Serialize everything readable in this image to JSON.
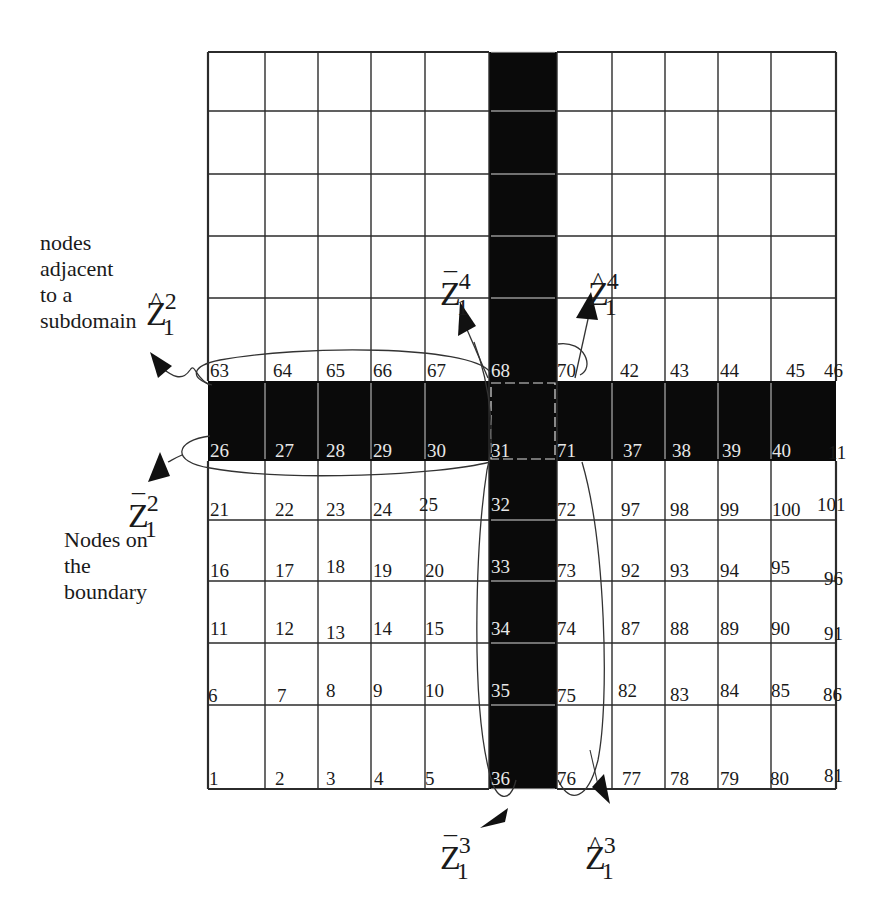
{
  "figure": {
    "colors": {
      "grid_line": "#2b2b2b",
      "separator_band": "#0a0a0a",
      "background": "#ffffff",
      "node_label_on_band": "#e8e8e8"
    }
  },
  "annotations": {
    "adjacent_label": [
      "nodes",
      "adjacent",
      "to a",
      "subdomain"
    ],
    "boundary_label": [
      "Nodes on",
      "the",
      "boundary"
    ],
    "symbols": {
      "zhat_1_2": {
        "base": "Z",
        "accent": "hat",
        "sub": "1",
        "sup": "2"
      },
      "zbar_1_2": {
        "base": "Z",
        "accent": "bar",
        "sub": "1",
        "sup": "2"
      },
      "zbar_1_4": {
        "base": "Z",
        "accent": "bar",
        "sub": "1",
        "sup": "4"
      },
      "zhat_1_4": {
        "base": "Z",
        "accent": "hat",
        "sub": "1",
        "sup": "4"
      },
      "zbar_1_3": {
        "base": "Z",
        "accent": "bar",
        "sub": "1",
        "sup": "3"
      },
      "zhat_1_3": {
        "base": "Z",
        "accent": "hat",
        "sub": "1",
        "sup": "3"
      }
    }
  },
  "grid": {
    "columns_x": [
      208,
      265,
      318,
      371,
      425,
      489,
      557,
      612,
      665,
      718,
      771,
      836
    ],
    "rows_y": [
      52,
      111,
      174,
      236,
      298,
      381,
      461,
      520,
      581,
      643,
      705,
      789
    ],
    "separator": {
      "vertical": {
        "x1": 489,
        "x2": 557
      },
      "horizontal": {
        "y1": 381,
        "y2": 461
      }
    }
  },
  "node_labels": {
    "row_top_of_band": [
      {
        "t": "63",
        "x": 210,
        "y": 380
      },
      {
        "t": "64",
        "x": 273,
        "y": 380
      },
      {
        "t": "65",
        "x": 326,
        "y": 380
      },
      {
        "t": "66",
        "x": 373,
        "y": 380
      },
      {
        "t": "67",
        "x": 427,
        "y": 380
      },
      {
        "t": "68",
        "x": 491,
        "y": 380,
        "light": true
      },
      {
        "t": "70",
        "x": 557,
        "y": 380
      },
      {
        "t": "42",
        "x": 620,
        "y": 380
      },
      {
        "t": "43",
        "x": 670,
        "y": 380
      },
      {
        "t": "44",
        "x": 720,
        "y": 380
      },
      {
        "t": "45",
        "x": 786,
        "y": 380
      },
      {
        "t": "46",
        "x": 824,
        "y": 380
      }
    ],
    "row_bottom_of_band": [
      {
        "t": "26",
        "x": 210,
        "y": 460,
        "light": true
      },
      {
        "t": "27",
        "x": 275,
        "y": 460,
        "light": true
      },
      {
        "t": "28",
        "x": 326,
        "y": 460,
        "light": true
      },
      {
        "t": "29",
        "x": 373,
        "y": 460,
        "light": true
      },
      {
        "t": "30",
        "x": 427,
        "y": 460,
        "light": true
      },
      {
        "t": "31",
        "x": 491,
        "y": 460,
        "light": true
      },
      {
        "t": "71",
        "x": 557,
        "y": 460,
        "light": true
      },
      {
        "t": "37",
        "x": 623,
        "y": 460,
        "light": true
      },
      {
        "t": "38",
        "x": 672,
        "y": 460,
        "light": true
      },
      {
        "t": "39",
        "x": 722,
        "y": 460,
        "light": true
      },
      {
        "t": "40",
        "x": 772,
        "y": 460,
        "light": true
      },
      {
        "t": "11",
        "x": 828,
        "y": 462
      }
    ],
    "row_520": [
      {
        "t": "21",
        "x": 210,
        "y": 519
      },
      {
        "t": "22",
        "x": 275,
        "y": 519
      },
      {
        "t": "23",
        "x": 326,
        "y": 519
      },
      {
        "t": "24",
        "x": 373,
        "y": 519
      },
      {
        "t": "25",
        "x": 419,
        "y": 514
      },
      {
        "t": "32",
        "x": 491,
        "y": 514,
        "light": true
      },
      {
        "t": "72",
        "x": 557,
        "y": 519
      },
      {
        "t": "97",
        "x": 621,
        "y": 519
      },
      {
        "t": "98",
        "x": 670,
        "y": 519
      },
      {
        "t": "99",
        "x": 720,
        "y": 519
      },
      {
        "t": "100",
        "x": 772,
        "y": 519
      },
      {
        "t": "101",
        "x": 817,
        "y": 514
      }
    ],
    "row_581": [
      {
        "t": "16",
        "x": 210,
        "y": 580
      },
      {
        "t": "17",
        "x": 275,
        "y": 580
      },
      {
        "t": "18",
        "x": 326,
        "y": 576
      },
      {
        "t": "19",
        "x": 373,
        "y": 580
      },
      {
        "t": "20",
        "x": 425,
        "y": 580
      },
      {
        "t": "33",
        "x": 491,
        "y": 576,
        "light": true
      },
      {
        "t": "73",
        "x": 557,
        "y": 580
      },
      {
        "t": "92",
        "x": 621,
        "y": 580
      },
      {
        "t": "93",
        "x": 670,
        "y": 580
      },
      {
        "t": "94",
        "x": 720,
        "y": 580
      },
      {
        "t": "95",
        "x": 771,
        "y": 577
      },
      {
        "t": "96",
        "x": 824,
        "y": 588
      }
    ],
    "row_643": [
      {
        "t": "11",
        "x": 210,
        "y": 638
      },
      {
        "t": "12",
        "x": 275,
        "y": 638
      },
      {
        "t": "13",
        "x": 326,
        "y": 642
      },
      {
        "t": "14",
        "x": 373,
        "y": 638
      },
      {
        "t": "15",
        "x": 425,
        "y": 638
      },
      {
        "t": "34",
        "x": 491,
        "y": 638,
        "light": true
      },
      {
        "t": "74",
        "x": 557,
        "y": 638
      },
      {
        "t": "87",
        "x": 621,
        "y": 638
      },
      {
        "t": "88",
        "x": 670,
        "y": 638
      },
      {
        "t": "89",
        "x": 720,
        "y": 638
      },
      {
        "t": "90",
        "x": 771,
        "y": 638
      },
      {
        "t": "91",
        "x": 824,
        "y": 643
      }
    ],
    "row_705": [
      {
        "t": "6",
        "x": 208,
        "y": 705
      },
      {
        "t": "7",
        "x": 277,
        "y": 705
      },
      {
        "t": "8",
        "x": 326,
        "y": 700
      },
      {
        "t": "9",
        "x": 373,
        "y": 700
      },
      {
        "t": "10",
        "x": 425,
        "y": 700
      },
      {
        "t": "35",
        "x": 491,
        "y": 700,
        "light": true
      },
      {
        "t": "75",
        "x": 557,
        "y": 705
      },
      {
        "t": "82",
        "x": 618,
        "y": 700
      },
      {
        "t": "83",
        "x": 670,
        "y": 704
      },
      {
        "t": "84",
        "x": 720,
        "y": 700
      },
      {
        "t": "85",
        "x": 771,
        "y": 700
      },
      {
        "t": "86",
        "x": 823,
        "y": 704
      }
    ],
    "row_789": [
      {
        "t": "1",
        "x": 209,
        "y": 788
      },
      {
        "t": "2",
        "x": 275,
        "y": 788
      },
      {
        "t": "3",
        "x": 326,
        "y": 788
      },
      {
        "t": "4",
        "x": 374,
        "y": 788
      },
      {
        "t": "5",
        "x": 425,
        "y": 788
      },
      {
        "t": "36",
        "x": 491,
        "y": 788,
        "light": true
      },
      {
        "t": "76",
        "x": 557,
        "y": 788
      },
      {
        "t": "77",
        "x": 622,
        "y": 788
      },
      {
        "t": "78",
        "x": 670,
        "y": 788
      },
      {
        "t": "79",
        "x": 720,
        "y": 788
      },
      {
        "t": "80",
        "x": 770,
        "y": 788
      },
      {
        "t": "81",
        "x": 824,
        "y": 785
      }
    ]
  }
}
